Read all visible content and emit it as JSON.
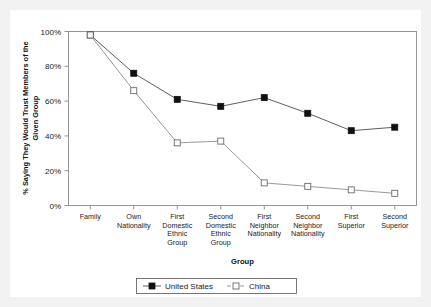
{
  "chart_data": {
    "type": "line",
    "title": "",
    "xlabel": "Group",
    "ylabel": "% Saying They Would Trust Members of the Given Group",
    "ylabel_lines": [
      "% Saying They Would Trust Members of the",
      "Given Group"
    ],
    "ylim": [
      0,
      100
    ],
    "ytick_labels": [
      "100%",
      "80%",
      "60%",
      "40%",
      "20%",
      "0%"
    ],
    "ytick_values": [
      100,
      80,
      60,
      40,
      20,
      0
    ],
    "grid": false,
    "legend_position": "bottom-center",
    "categories": [
      "Family",
      "Own Nationality",
      "First Domestic Ethnic Group",
      "Second Domestic Ethnic Group",
      "First Neighbor Nationality",
      "Second Neighbor Nationality",
      "First Superior",
      "Second Superior"
    ],
    "category_lines": [
      [
        "Family"
      ],
      [
        "Own",
        "Nationality"
      ],
      [
        "First",
        "Domestic",
        "Ethnic",
        "Group"
      ],
      [
        "Second",
        "Domestic",
        "Ethnic",
        "Group"
      ],
      [
        "First",
        "Neighbor",
        "Nationality"
      ],
      [
        "Second",
        "Neighbor",
        "Nationality"
      ],
      [
        "First",
        "Superior"
      ],
      [
        "Second",
        "Superior"
      ]
    ],
    "series": [
      {
        "name": "United States",
        "marker": "filled-square",
        "line_style": "solid",
        "color": "#111111",
        "values": [
          98,
          76,
          61,
          57,
          62,
          53,
          43,
          45
        ]
      },
      {
        "name": "China",
        "marker": "open-square",
        "line_style": "dashed",
        "color": "#6b6b6b",
        "values": [
          98,
          66,
          36,
          37,
          13,
          11,
          9,
          7
        ]
      }
    ]
  },
  "legend": {
    "entries": [
      {
        "label": "United States"
      },
      {
        "label": "China"
      }
    ]
  },
  "colors": {
    "background": "#f2f2f2",
    "plot_background": "#ffffff",
    "axis": "#8a8a8a",
    "us_series": "#111111",
    "china_series": "#6b6b6b"
  }
}
